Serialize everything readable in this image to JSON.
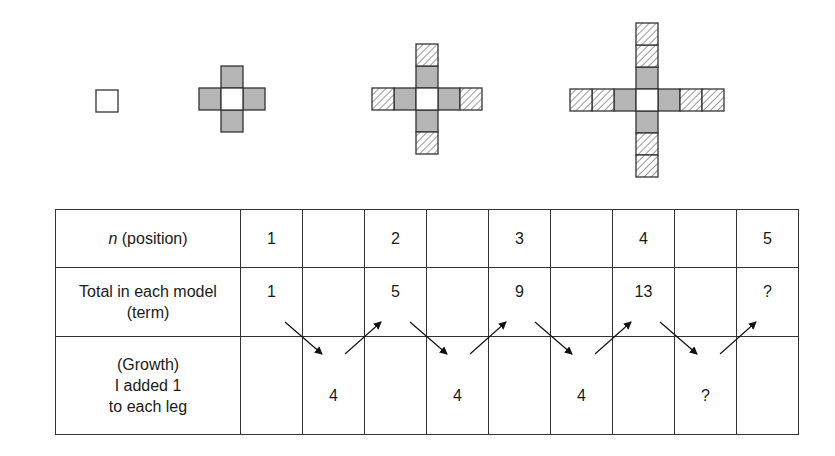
{
  "figures": [
    {
      "position": 1,
      "center_tiles": 1,
      "shaded_tiles": 0,
      "hatched_tiles": 0,
      "total": 1
    },
    {
      "position": 2,
      "center_tiles": 1,
      "shaded_tiles": 4,
      "hatched_tiles": 0,
      "total": 5
    },
    {
      "position": 3,
      "center_tiles": 1,
      "shaded_tiles": 4,
      "hatched_tiles": 4,
      "total": 9
    },
    {
      "position": 4,
      "center_tiles": 1,
      "shaded_tiles": 4,
      "hatched_tiles": 8,
      "total": 13
    }
  ],
  "table": {
    "row_labels": {
      "position_var": "n",
      "position": " (position)",
      "term_line1": "Total in each model",
      "term_line2": "(term)",
      "growth_line1": "(Growth)",
      "growth_line2": "I added 1",
      "growth_line3": "to each leg"
    },
    "positions": [
      "1",
      "",
      "2",
      "",
      "3",
      "",
      "4",
      "",
      "5"
    ],
    "terms": [
      "1",
      "",
      "5",
      "",
      "9",
      "",
      "13",
      "",
      "?"
    ],
    "growth": [
      "",
      "4",
      "",
      "4",
      "",
      "4",
      "",
      "?",
      ""
    ]
  },
  "colors": {
    "line": "#333333",
    "shaded_fill": "#b5b5b5",
    "hatch": "#444444",
    "center_fill": "#ffffff"
  }
}
